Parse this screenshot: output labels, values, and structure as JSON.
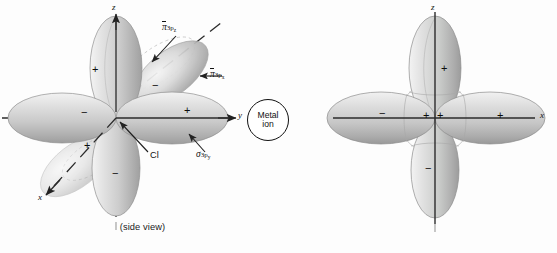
{
  "panels": [
    {
      "id": "side-view",
      "caption": "(side view)",
      "axes": [
        {
          "name": "z",
          "label": "z",
          "direction": "up",
          "style": "solid-arrow"
        },
        {
          "name": "y",
          "label": "y",
          "direction": "right",
          "style": "solid-arrow"
        },
        {
          "name": "x",
          "label": "x",
          "direction": "lower-left-diagonal",
          "style": "dashed-arrow"
        }
      ],
      "orbital_labels": [
        {
          "name": "pi-3pz",
          "symbol": "π",
          "overbar": true,
          "sub": "3p",
          "subsub": "z"
        },
        {
          "name": "pi-3px",
          "symbol": "π",
          "overbar": true,
          "sub": "3p",
          "subsub": "x"
        },
        {
          "name": "sigma-3py",
          "symbol": "σ",
          "overbar": false,
          "sub": "3p",
          "subsub": "y"
        }
      ],
      "atom_label": "Cl",
      "metal_label_line1": "Metal",
      "metal_label_line2": "ion",
      "lobe_signs": [
        {
          "lobe": "z-up",
          "sign": "+"
        },
        {
          "lobe": "z-down",
          "sign": "−"
        },
        {
          "lobe": "y-right",
          "sign": "+"
        },
        {
          "lobe": "y-left",
          "sign": "−"
        },
        {
          "lobe": "x-near",
          "sign": "+"
        },
        {
          "lobe": "x-far",
          "sign": "−"
        }
      ]
    },
    {
      "id": "end-on-view",
      "caption": "(looking down the M−L axis from M to L)",
      "axes": [
        {
          "name": "z",
          "label": "z",
          "direction": "up",
          "style": "solid"
        },
        {
          "name": "x",
          "label": "x",
          "direction": "right",
          "style": "solid"
        }
      ],
      "lobe_signs": [
        {
          "lobe": "z-up",
          "sign": "+"
        },
        {
          "lobe": "z-down",
          "sign": "−"
        },
        {
          "lobe": "x-right",
          "sign": "+"
        },
        {
          "lobe": "x-left",
          "sign": "−"
        },
        {
          "lobe": "center-left",
          "sign": "+"
        },
        {
          "lobe": "center-right",
          "sign": "+"
        }
      ]
    }
  ],
  "colors": {
    "axis": "#2b2b2b",
    "lobe_light": "#efefef",
    "lobe_mid": "#c9c9c9",
    "lobe_dark": "#9a9a9a",
    "outline": "#8d8d8d",
    "text": "#141414",
    "background": "#fdfdfd"
  }
}
